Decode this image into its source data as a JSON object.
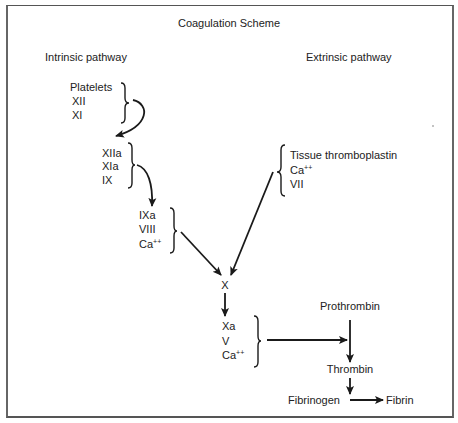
{
  "diagram": {
    "title": "Coagulation Scheme",
    "pathways": {
      "intrinsic": {
        "label": "Intrinsic pathway",
        "group1": [
          "Platelets",
          "XII",
          "XI"
        ],
        "group2": [
          "XIIa",
          "XIa",
          "IX"
        ],
        "group3": [
          "IXa",
          "VIII",
          "Ca",
          "++"
        ]
      },
      "extrinsic": {
        "label": "Extrinsic pathway",
        "group1": [
          "Tissue thromboplastin",
          "Ca",
          "++",
          "VII"
        ]
      }
    },
    "common": {
      "factor_x": "X",
      "group_xa": [
        "Xa",
        "V",
        "Ca",
        "++"
      ],
      "prothrombin": "Prothrombin",
      "thrombin": "Thrombin",
      "fibrinogen": "Fibrinogen",
      "fibrin": "Fibrin"
    },
    "colors": {
      "ink": "#1a1a1a",
      "background": "#ffffff",
      "border": "#555555"
    }
  }
}
